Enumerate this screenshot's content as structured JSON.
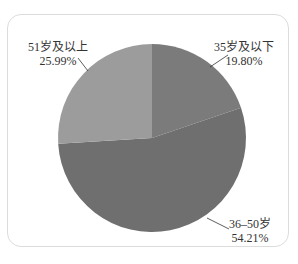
{
  "chart_data": {
    "type": "pie",
    "title": "",
    "categories": [
      "35岁及以下",
      "36–50岁",
      "51岁及以上"
    ],
    "values": [
      19.8,
      54.21,
      25.99
    ],
    "value_labels": [
      "19.80%",
      "54.21%",
      "25.99%"
    ],
    "colors": [
      "#7b7b7b",
      "#6f6f6f",
      "#9c9c9c"
    ],
    "start_angle_deg": 0,
    "direction": "clockwise",
    "legend": "none",
    "labels_position": "outside-with-leader-lines"
  },
  "labels": {
    "young": {
      "name": "35岁及以下",
      "pct": "19.80%"
    },
    "middle": {
      "name": "36–50岁",
      "pct": "54.21%"
    },
    "senior": {
      "name": "51岁及以上",
      "pct": "25.99%"
    }
  }
}
